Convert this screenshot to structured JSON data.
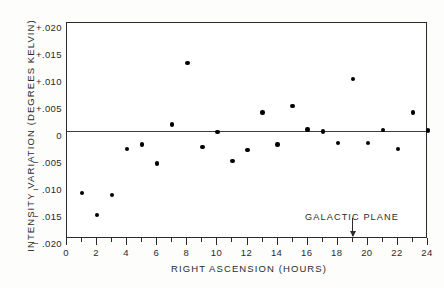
{
  "chart_data": {
    "type": "scatter",
    "title": "",
    "xlabel": "RIGHT ASCENSION (HOURS)",
    "ylabel": "INTENSITY VARIATION (DEGREES KELVIN)",
    "xlim": [
      0,
      24
    ],
    "ylim": [
      -0.02,
      0.02
    ],
    "grid": false,
    "legend": null,
    "xticks": [
      0,
      2,
      4,
      6,
      8,
      10,
      12,
      14,
      16,
      18,
      20,
      22,
      24
    ],
    "xtick_labels": [
      "0",
      "2",
      "4",
      "6",
      "8",
      "10",
      "12",
      "14",
      "16",
      "18",
      "20",
      "22",
      "24"
    ],
    "xminor_tick_step": 1,
    "yticks": [
      0.02,
      0.015,
      0.01,
      0.005,
      0,
      -0.005,
      -0.01,
      -0.015,
      -0.02
    ],
    "ytick_labels": [
      "+.020",
      "+.015",
      "+.010",
      "+.005",
      "0",
      "− .005",
      "− .010",
      "− .015",
      "− .020"
    ],
    "reference_line": {
      "y": 0,
      "style": "solid",
      "color": "#3c3c3c"
    },
    "x": [
      1,
      2,
      3,
      4,
      5,
      6,
      7,
      8,
      9,
      10,
      11,
      12,
      13,
      14,
      15,
      16,
      17,
      18,
      19,
      20,
      21,
      22,
      23,
      24
    ],
    "y": [
      -0.0115,
      -0.0155,
      -0.0118,
      -0.0033,
      -0.0025,
      -0.006,
      0.0012,
      0.0126,
      -0.003,
      -0.0002,
      -0.0055,
      -0.0035,
      0.0034,
      -0.0025,
      0.0046,
      0.0003,
      -0.0001,
      -0.0022,
      0.0096,
      -0.0022,
      0.0002,
      -0.0033,
      0.0034,
      0.0001
    ],
    "marker": "circle",
    "marker_color": "#000000",
    "annotations": [
      {
        "text": "GALACTIC PLANE",
        "x": 19,
        "kind": "arrow-down",
        "points_to_axis": "x"
      }
    ]
  },
  "axes": {
    "x_title": "RIGHT ASCENSION (HOURS)",
    "y_title": "INTENSITY VARIATION (DEGREES KELVIN)"
  },
  "annotation": {
    "galactic_plane_label": "GALACTIC PLANE"
  },
  "colors": {
    "frame": "#2b2b2b",
    "marker": "#000000",
    "zero_line": "#3c3c3c",
    "background": "#ffffff"
  }
}
